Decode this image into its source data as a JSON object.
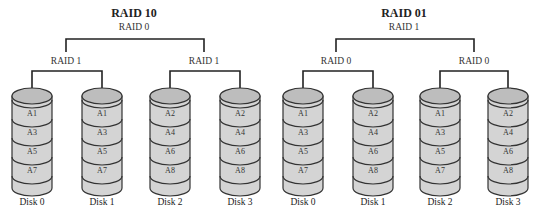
{
  "colors": {
    "line": "#222222",
    "disk_fill": "#d4d4d4",
    "disk_top_fill": "#bdbdbd",
    "disk_stroke": "#333333",
    "background": "#ffffff"
  },
  "diagrams": [
    {
      "title": "RAID 10",
      "top_level": "RAID 0",
      "groups": [
        {
          "label": "RAID 1"
        },
        {
          "label": "RAID 1"
        }
      ],
      "disks": [
        {
          "label": "Disk 0",
          "blocks": [
            "A1",
            "A3",
            "A5",
            "A7"
          ]
        },
        {
          "label": "Disk 1",
          "blocks": [
            "A1",
            "A3",
            "A5",
            "A7"
          ]
        },
        {
          "label": "Disk 2",
          "blocks": [
            "A2",
            "A4",
            "A6",
            "A8"
          ]
        },
        {
          "label": "Disk 3",
          "blocks": [
            "A2",
            "A4",
            "A6",
            "A8"
          ]
        }
      ]
    },
    {
      "title": "RAID 01",
      "top_level": "RAID 1",
      "groups": [
        {
          "label": "RAID 0"
        },
        {
          "label": "RAID 0"
        }
      ],
      "disks": [
        {
          "label": "Disk 0",
          "blocks": [
            "A1",
            "A3",
            "A5",
            "A7"
          ]
        },
        {
          "label": "Disk 1",
          "blocks": [
            "A2",
            "A4",
            "A6",
            "A8"
          ]
        },
        {
          "label": "Disk 2",
          "blocks": [
            "A1",
            "A3",
            "A5",
            "A7"
          ]
        },
        {
          "label": "Disk 3",
          "blocks": [
            "A2",
            "A4",
            "A6",
            "A8"
          ]
        }
      ]
    }
  ]
}
